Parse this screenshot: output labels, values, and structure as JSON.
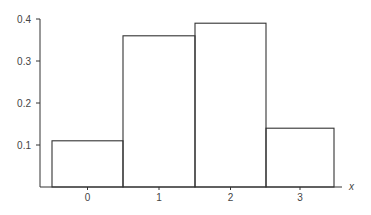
{
  "chart_data": {
    "type": "bar",
    "title": "",
    "xlabel": "x",
    "ylabel": "",
    "categories": [
      "0",
      "1",
      "2",
      "3"
    ],
    "values": [
      0.11,
      0.36,
      0.39,
      0.14
    ],
    "ylim": [
      0,
      0.4
    ],
    "yticks": [
      "0.1",
      "0.2",
      "0.3",
      "0.4"
    ],
    "grid": false,
    "legend": null,
    "style": "histogram outline, no fill"
  }
}
